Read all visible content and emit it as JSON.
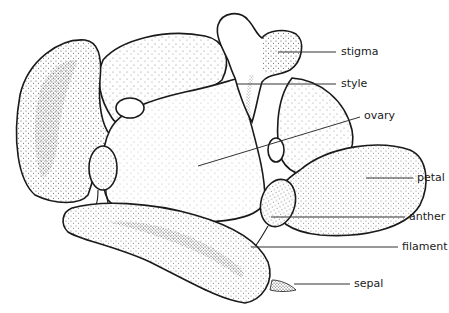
{
  "diagram": {
    "labels": [
      {
        "id": "stigma",
        "text": "stigma"
      },
      {
        "id": "style",
        "text": "style"
      },
      {
        "id": "ovary",
        "text": "ovary"
      },
      {
        "id": "petal",
        "text": "petal"
      },
      {
        "id": "anther",
        "text": "anther"
      },
      {
        "id": "filament",
        "text": "filament"
      },
      {
        "id": "sepal",
        "text": "sepal"
      }
    ],
    "colors": {
      "ink": "#1a1a1a",
      "background": "#ffffff"
    }
  }
}
